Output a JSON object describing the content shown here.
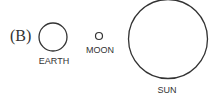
{
  "diagram": {
    "part_label": "(B)",
    "bodies": [
      {
        "name": "EARTH",
        "cx": 53,
        "cy": 37,
        "r": 14,
        "label_x": 53,
        "label_y": 55
      },
      {
        "name": "MOON",
        "cx": 99,
        "cy": 36,
        "r": 4,
        "label_x": 100,
        "label_y": 45
      },
      {
        "name": "SUN",
        "cx": 168,
        "cy": 39,
        "r": 40,
        "label_x": 168,
        "label_y": 84
      }
    ],
    "stroke_color": "#333333"
  }
}
